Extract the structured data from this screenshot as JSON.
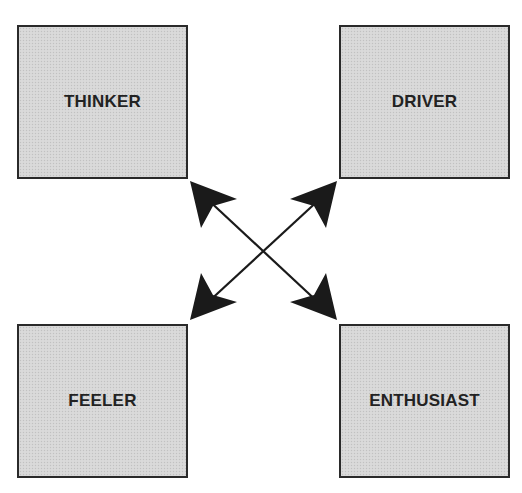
{
  "diagram": {
    "type": "quadrant",
    "colors": {
      "box_fill": "#d7d7d7",
      "box_border": "#2a2a2a",
      "label": "#222222",
      "arrow": "#1a1a1a",
      "background": "#ffffff"
    },
    "quadrants": [
      {
        "id": "thinker",
        "position": "top-left",
        "label": "THINKER"
      },
      {
        "id": "driver",
        "position": "top-right",
        "label": "DRIVER"
      },
      {
        "id": "feeler",
        "position": "bottom-left",
        "label": "FEELER"
      },
      {
        "id": "enthusiast",
        "position": "bottom-right",
        "label": "ENTHUSIAST"
      }
    ],
    "connectors": [
      {
        "from": "thinker",
        "to": "enthusiast",
        "style": "double-headed-arrow"
      },
      {
        "from": "driver",
        "to": "feeler",
        "style": "double-headed-arrow"
      }
    ]
  }
}
